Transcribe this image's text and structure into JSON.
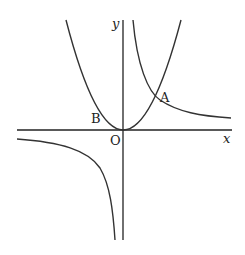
{
  "diagram": {
    "axes": {
      "x_label": "x",
      "y_label": "y",
      "origin_label": "O"
    },
    "points": [
      {
        "label": "A",
        "description": "intersection of parabola and hyperbola in first quadrant"
      },
      {
        "label": "B",
        "description": "point on parabola in second quadrant near origin"
      }
    ],
    "curves": [
      {
        "name": "parabola",
        "description": "upward-opening parabola with vertex at origin"
      },
      {
        "name": "hyperbola",
        "description": "reciprocal-type curve with branches in first and third quadrants"
      }
    ],
    "colors": {
      "stroke": "#222222",
      "background": "#ffffff"
    }
  }
}
